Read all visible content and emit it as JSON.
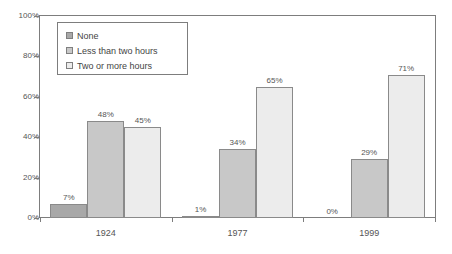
{
  "chart_data": {
    "type": "bar",
    "title": "",
    "xlabel": "",
    "ylabel": "",
    "ylim": [
      0,
      100
    ],
    "ytick_labels": [
      "0%",
      "20%",
      "40%",
      "60%",
      "80%",
      "100%"
    ],
    "ytick_values": [
      0,
      20,
      40,
      60,
      80,
      100
    ],
    "grid": false,
    "legend_position": "top-left-inside",
    "categories": [
      "1924",
      "1977",
      "1999"
    ],
    "series": [
      {
        "name": "None",
        "color": "#a8a8a8",
        "values": [
          7,
          1,
          0
        ],
        "labels": [
          "7%",
          "1%",
          "0%"
        ]
      },
      {
        "name": "Less than two hours",
        "color": "#c8c8c8",
        "values": [
          48,
          34,
          29
        ],
        "labels": [
          "48%",
          "34%",
          "29%"
        ]
      },
      {
        "name": "Two or more hours",
        "color": "#ececec",
        "values": [
          45,
          65,
          71
        ],
        "labels": [
          "45%",
          "65%",
          "71%"
        ]
      }
    ]
  },
  "legend": {
    "items": [
      {
        "label": "None"
      },
      {
        "label": "Less than two hours"
      },
      {
        "label": "Two or more hours"
      }
    ]
  },
  "axes": {
    "y": {
      "ticks": [
        {
          "label": "100%"
        },
        {
          "label": "80%"
        },
        {
          "label": "60%"
        },
        {
          "label": "40%"
        },
        {
          "label": "20%"
        },
        {
          "label": "0%"
        }
      ]
    },
    "x": {
      "ticks": [
        {
          "label": "1924"
        },
        {
          "label": "1977"
        },
        {
          "label": "1999"
        }
      ]
    }
  },
  "colors": {
    "series_none": "#a8a8a8",
    "series_less_than_two_hours": "#c8c8c8",
    "series_two_or_more_hours": "#ececec",
    "axis": "#7d7d7d",
    "text": "#555555"
  }
}
